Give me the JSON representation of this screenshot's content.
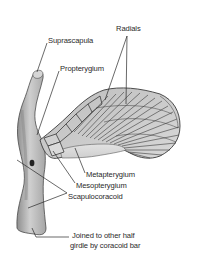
{
  "diagram": {
    "labels": [
      {
        "id": "radials",
        "text": "Radials"
      },
      {
        "id": "suprascapula",
        "text": "Suprascapula"
      },
      {
        "id": "propterygium",
        "text": "Propterygium"
      },
      {
        "id": "metapterygium",
        "text": "Metapterygium"
      },
      {
        "id": "mesopterygium",
        "text": "Mesopterygium"
      },
      {
        "id": "scapulocoracoid",
        "text": "Scapulocoracoid"
      },
      {
        "id": "coracoid_note_line1",
        "text": "Joined to other half"
      },
      {
        "id": "coracoid_note_line2",
        "text": "girdle by coracoid bar"
      }
    ],
    "colors": {
      "bone_fill": "#c9c9c9",
      "bone_shade": "#9a9a9a",
      "outline": "#3a3a3a",
      "leader": "#2a2a2a",
      "text": "#2a2a2a"
    }
  }
}
